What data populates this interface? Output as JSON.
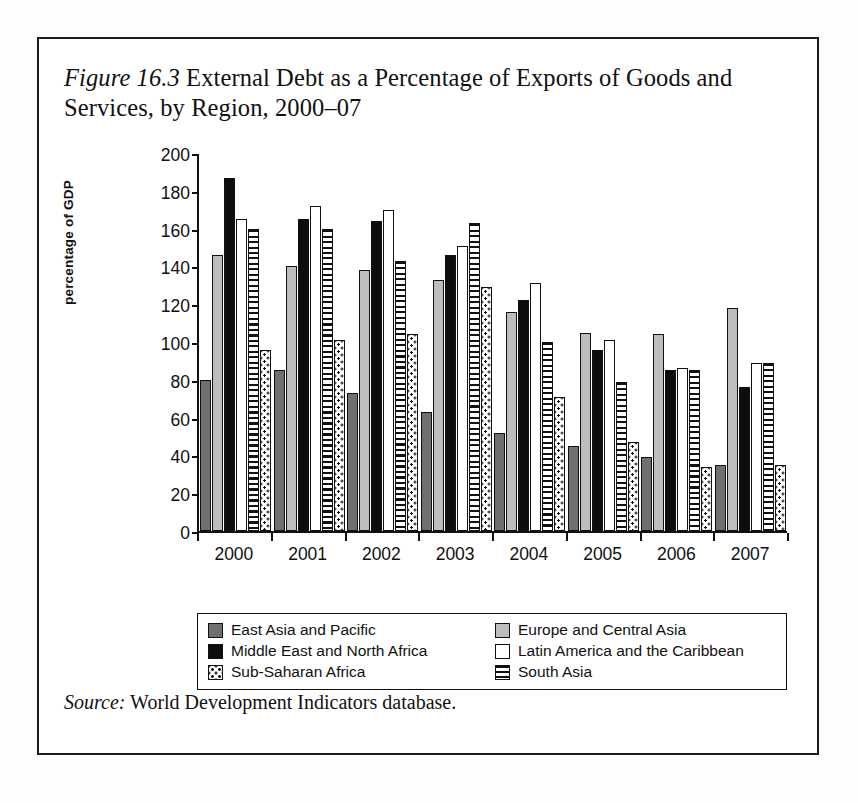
{
  "figure": {
    "label": "Figure 16.3",
    "caption": " External Debt as a Percentage of Exports of Goods and Services, by Region, 2000–07",
    "source_label": "Source:",
    "source_text": " World Development Indicators database."
  },
  "chart_data": {
    "type": "bar",
    "title": "Figure 16.3 External Debt as a Percentage of Exports of Goods and Services, by Region, 2000–07",
    "xlabel": "",
    "ylabel": "percentage of GDP",
    "ylim": [
      0,
      200
    ],
    "yticks": [
      0,
      20,
      40,
      60,
      80,
      100,
      120,
      140,
      160,
      180,
      200
    ],
    "grid": false,
    "legend_position": "below-axes",
    "categories": [
      "2000",
      "2001",
      "2002",
      "2003",
      "2004",
      "2005",
      "2006",
      "2007"
    ],
    "series": [
      {
        "name": "East Asia and Pacific",
        "color": "#6f6f6f",
        "pattern": "solid-dark-gray",
        "values": [
          80,
          85,
          73,
          63,
          52,
          45,
          39,
          35
        ]
      },
      {
        "name": "Europe and Central Asia",
        "color": "#bdbdbd",
        "pattern": "solid-light-gray",
        "values": [
          146,
          140,
          138,
          133,
          116,
          105,
          104,
          118
        ]
      },
      {
        "name": "Middle East and North Africa",
        "color": "#0d0d0d",
        "pattern": "solid-black",
        "values": [
          187,
          165,
          164,
          146,
          122,
          96,
          85,
          76
        ]
      },
      {
        "name": "Latin America and the Caribbean",
        "color": "#ffffff",
        "pattern": "solid-white",
        "values": [
          165,
          172,
          170,
          151,
          131,
          101,
          86,
          89
        ]
      },
      {
        "name": "South Asia",
        "color": "#ffffff",
        "pattern": "horizontal-stripes",
        "values": [
          160,
          160,
          143,
          163,
          100,
          79,
          85,
          89
        ]
      },
      {
        "name": "Sub-Saharan Africa",
        "color": "#ffffff",
        "pattern": "dots",
        "values": [
          96,
          101,
          104,
          129,
          71,
          47,
          34,
          35
        ]
      }
    ]
  },
  "legend": {
    "items": [
      {
        "label": "East Asia and Pacific",
        "swatch": "s0"
      },
      {
        "label": "Europe and Central Asia",
        "swatch": "s1"
      },
      {
        "label": "Middle East and North Africa",
        "swatch": "s2"
      },
      {
        "label": "Latin America and the Caribbean",
        "swatch": "s3"
      },
      {
        "label": "Sub-Saharan Africa",
        "swatch": "sw5"
      },
      {
        "label": "South Asia",
        "swatch": "sw4"
      }
    ]
  }
}
